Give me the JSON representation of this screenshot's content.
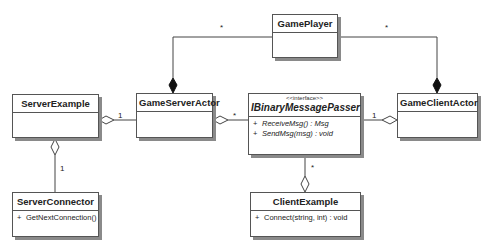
{
  "diagram": {
    "type": "UML class diagram",
    "classes": [
      {
        "id": "GamePlayer",
        "name": "GamePlayer",
        "stereotype": "",
        "italic": false,
        "operations": []
      },
      {
        "id": "ServerExample",
        "name": "ServerExample",
        "stereotype": "",
        "italic": false,
        "operations": []
      },
      {
        "id": "GameServerActor",
        "name": "GameServerActor",
        "stereotype": "",
        "italic": false,
        "operations": []
      },
      {
        "id": "IBinaryMessagePasser",
        "name": "IBinaryMessagePasser",
        "stereotype": "<<interface>>",
        "italic": true,
        "operations": [
          {
            "visibility": "+",
            "signature": "ReceiveMsg() : Msg"
          },
          {
            "visibility": "+",
            "signature": "SendMsg(msg) : void"
          }
        ]
      },
      {
        "id": "GameClientActor",
        "name": "GameClientActor",
        "stereotype": "",
        "italic": false,
        "operations": []
      },
      {
        "id": "ServerConnector",
        "name": "ServerConnector",
        "stereotype": "",
        "italic": false,
        "operations": [
          {
            "visibility": "+",
            "signature": "GetNextConnection()"
          }
        ]
      },
      {
        "id": "ClientExample",
        "name": "ClientExample",
        "stereotype": "",
        "italic": false,
        "operations": [
          {
            "visibility": "+",
            "signature": "Connect(string, int) : void"
          }
        ]
      }
    ],
    "relationships": [
      {
        "from": "GameServerActor",
        "to": "GamePlayer",
        "kind": "composition",
        "diamond_at": "GameServerActor",
        "multiplicity": "*"
      },
      {
        "from": "GameClientActor",
        "to": "GamePlayer",
        "kind": "composition",
        "diamond_at": "GameClientActor",
        "multiplicity": "*"
      },
      {
        "from": "ServerExample",
        "to": "GameServerActor",
        "kind": "aggregation",
        "diamond_at": "ServerExample",
        "multiplicity": "1"
      },
      {
        "from": "GameServerActor",
        "to": "IBinaryMessagePasser",
        "kind": "aggregation",
        "diamond_at": "GameServerActor",
        "multiplicity": "*"
      },
      {
        "from": "GameClientActor",
        "to": "IBinaryMessagePasser",
        "kind": "aggregation",
        "diamond_at": "GameClientActor",
        "multiplicity": "1"
      },
      {
        "from": "ServerExample",
        "to": "ServerConnector",
        "kind": "aggregation",
        "diamond_at": "ServerExample",
        "multiplicity": "1"
      },
      {
        "from": "ClientExample",
        "to": "IBinaryMessagePasser",
        "kind": "aggregation",
        "diamond_at": "ClientExample",
        "multiplicity": "*"
      }
    ],
    "multiplicity_labels": {
      "gameplayer_server": "*",
      "gameplayer_client": "*",
      "serverexample_gameserveractor": "1",
      "gameserveractor_passer": "*",
      "passer_gameclientactor": "1",
      "serverexample_serverconnector": "1",
      "passer_clientexample": "*"
    },
    "colors": {
      "line": "#444444",
      "box_border": "#555555",
      "shadow": "#8a8a8a",
      "background": "#ffffff"
    }
  }
}
